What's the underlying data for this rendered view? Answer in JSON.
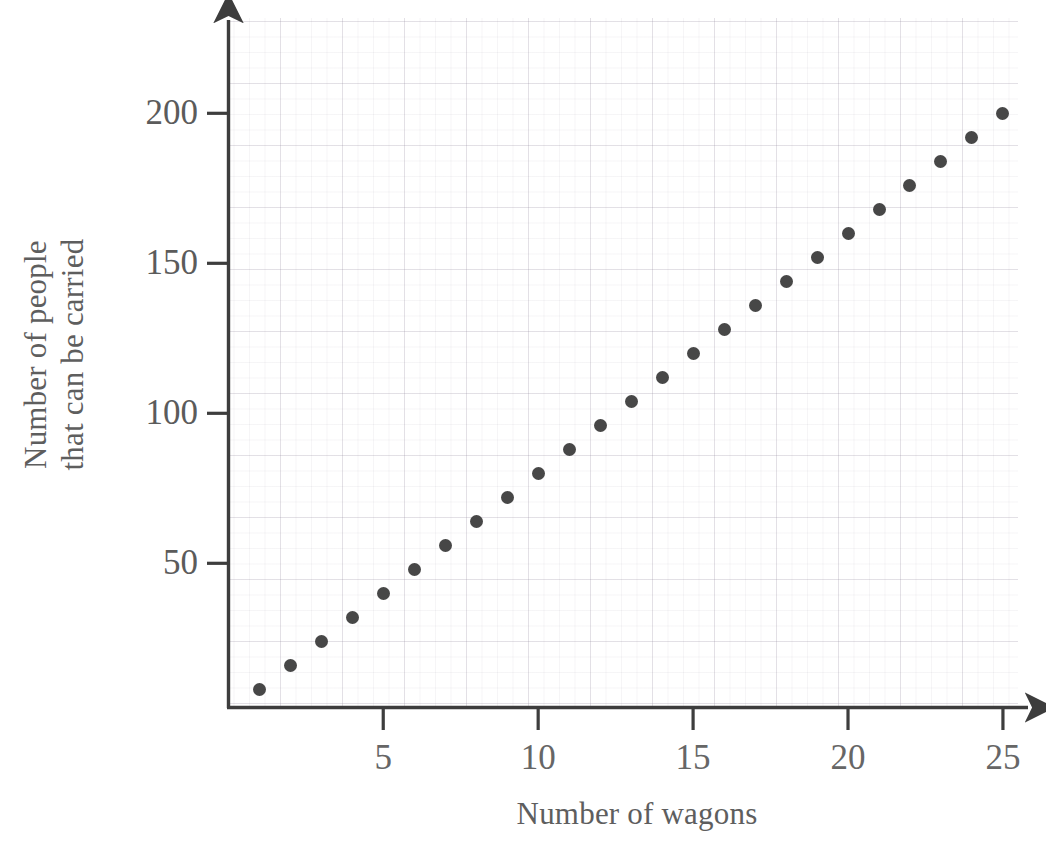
{
  "chart_data": {
    "type": "scatter",
    "title": "",
    "xlabel": "Number of wagons",
    "ylabel": "Number of people that can be carried",
    "ylabel_lines": [
      "Number of people",
      "that can be carried"
    ],
    "x": [
      1,
      2,
      3,
      4,
      5,
      6,
      7,
      8,
      9,
      10,
      11,
      12,
      13,
      14,
      15,
      16,
      17,
      18,
      19,
      20,
      21,
      22,
      23,
      24,
      25
    ],
    "values": [
      8,
      16,
      24,
      32,
      40,
      48,
      56,
      64,
      72,
      80,
      88,
      96,
      104,
      112,
      120,
      128,
      136,
      144,
      152,
      160,
      168,
      176,
      184,
      192,
      200
    ],
    "xlim": [
      0,
      26
    ],
    "ylim": [
      0,
      228
    ],
    "xticks": [
      5,
      10,
      15,
      20,
      25
    ],
    "xtick_labels": [
      "5",
      "10",
      "15",
      "20",
      "25"
    ],
    "yticks": [
      50,
      100,
      150,
      200
    ],
    "ytick_labels": [
      "50",
      "100",
      "150",
      "200"
    ],
    "grid": true,
    "grid_style": "faint graph paper",
    "legend": null,
    "marker": "filled-circle",
    "marker_color": "#474747",
    "axis_color": "#3d3d3d",
    "text_color": "#5e5e5e",
    "axis_arrows": true,
    "background": "#ffffff"
  }
}
